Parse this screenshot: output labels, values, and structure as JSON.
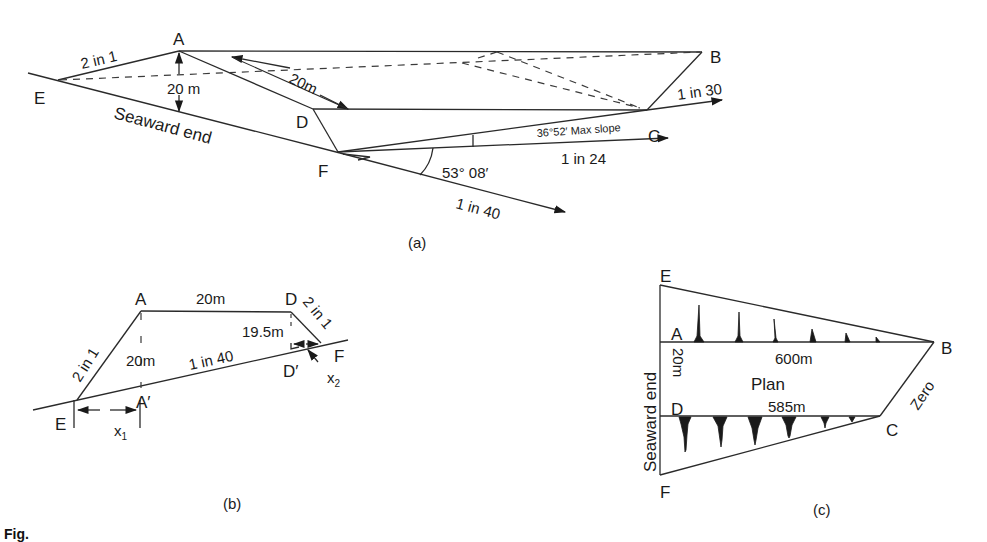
{
  "figure_a": {
    "caption": "(a)",
    "points": {
      "A": "A",
      "B": "B",
      "C": "C",
      "D": "D",
      "E": "E",
      "F": "F"
    },
    "labels": {
      "side_slope": "2 in 1",
      "height": "20 m",
      "top_width": "20m",
      "seaward_end": "Seaward end",
      "slope_bc": "1 in 30",
      "max_slope": "36°52′ Max slope",
      "slope_fc": "1 in 24",
      "angle": "53° 08′",
      "slope_ground": "1 in 40"
    }
  },
  "figure_b": {
    "caption": "(b)",
    "points": {
      "A": "A",
      "D": "D",
      "E": "E",
      "F": "F",
      "A_prime": "A′",
      "D_prime": "D′"
    },
    "labels": {
      "top_width": "20m",
      "left_slope": "2 in 1",
      "right_slope": "2 in 1",
      "height": "20m",
      "ground_slope": "1 in 40",
      "d_height": "19.5m",
      "x1": "x",
      "x1_sub": "1",
      "x2": "x",
      "x2_sub": "2"
    }
  },
  "figure_c": {
    "caption": "(c)",
    "points": {
      "A": "A",
      "B": "B",
      "C": "C",
      "D": "D",
      "E": "E",
      "F": "F"
    },
    "labels": {
      "length_ab": "600m",
      "title": "Plan",
      "length_dc": "585m",
      "width": "20m",
      "seaward_end": "Seaward end",
      "zero": "Zero"
    }
  },
  "caption": {
    "text": "Fig."
  }
}
